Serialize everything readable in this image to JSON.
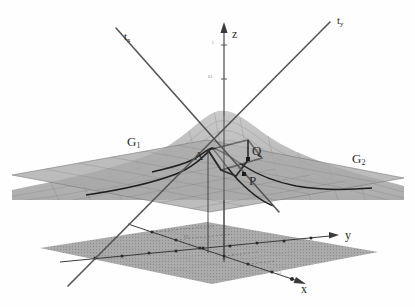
{
  "figure": {
    "type": "3d-math-diagram",
    "background": "#ffffff"
  },
  "colors": {
    "surface_fill": "#b4b4b4",
    "surface_top": "#c6c6c6",
    "plane_fill": "#a9a9a9",
    "grid_plane_fill": "#9c9c9c",
    "mesh_line": "#7a7a7a",
    "curve_dark": "#1f1f1f",
    "axis": "#3a3a3a",
    "tangent_line": "#555555",
    "label_text": "#2b2b2b"
  },
  "axes": {
    "z": {
      "label": "z",
      "ticks": [
        "1",
        "0.5"
      ]
    },
    "y": {
      "label": "y"
    },
    "x": {
      "label": "x"
    }
  },
  "tangent_lines": [
    {
      "name": "t-x",
      "base": "t",
      "sub": "x"
    },
    {
      "name": "t-y",
      "base": "t",
      "sub": "y"
    }
  ],
  "curves": [
    {
      "name": "G1",
      "base": "G",
      "sub": "1"
    },
    {
      "name": "G2",
      "base": "G",
      "sub": "2"
    }
  ],
  "points": [
    {
      "name": "A",
      "label": "A"
    },
    {
      "name": "Q",
      "label": "Q"
    },
    {
      "name": "P",
      "label": "P"
    }
  ],
  "ground_ticks": [
    "0.5",
    "1",
    "1.5"
  ]
}
